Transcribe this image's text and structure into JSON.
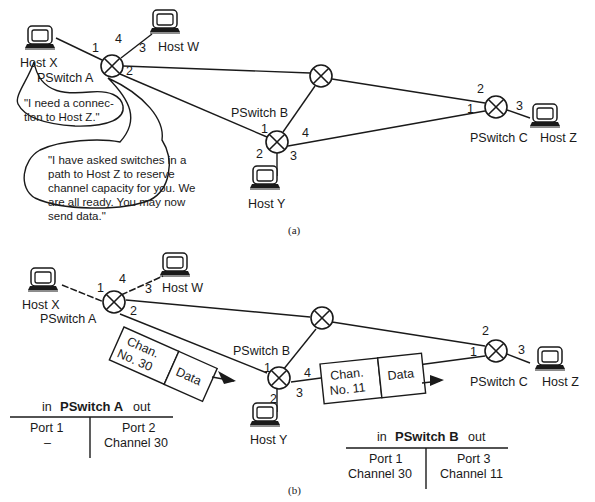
{
  "figure_a": {
    "caption": "(a)",
    "hosts": {
      "x": "Host X",
      "w": "Host W",
      "y": "Host Y",
      "z": "Host Z"
    },
    "switches": {
      "a": "PSwitch A",
      "b": "PSwitch B",
      "c": "PSwitch C"
    },
    "ports": {
      "a1": "1",
      "a2": "2",
      "a3": "3",
      "a4": "4",
      "b1": "1",
      "b2": "2",
      "b3": "3",
      "b4": "4",
      "c1": "1",
      "c2": "2",
      "c3": "3"
    },
    "bubble1": [
      "\"I need a connec-",
      "tion to Host Z.\""
    ],
    "bubble2": [
      "\"I have asked switches in a",
      "path to Host Z to reserve",
      "channel capacity for you. We",
      "are all ready. You may now",
      "send data.\""
    ]
  },
  "figure_b": {
    "caption": "(b)",
    "hosts": {
      "x": "Host X",
      "w": "Host W",
      "y": "Host Y",
      "z": "Host Z"
    },
    "switches": {
      "a": "PSwitch A",
      "b": "PSwitch B",
      "c": "PSwitch C"
    },
    "ports": {
      "a1": "1",
      "a2": "2",
      "a3": "3",
      "a4": "4",
      "b1": "1",
      "b2": "2",
      "b3": "3",
      "b4": "4",
      "c1": "1",
      "c2": "2",
      "c3": "3"
    },
    "packet1": {
      "chan_line1": "Chan.",
      "chan_line2": "No. 30",
      "data": "Data"
    },
    "packet2": {
      "chan_line1": "Chan.",
      "chan_line2": "No. 11",
      "data": "Data"
    },
    "table_a": {
      "in": "in",
      "title": "PSwitch A",
      "out": "out",
      "in_port": "Port 1",
      "in_channel": "–",
      "out_port": "Port 2",
      "out_channel": "Channel 30"
    },
    "table_b": {
      "in": "in",
      "title": "PSwitch B",
      "out": "out",
      "in_port": "Port 1",
      "in_channel": "Channel 30",
      "out_port": "Port 3",
      "out_channel": "Channel 11"
    }
  }
}
